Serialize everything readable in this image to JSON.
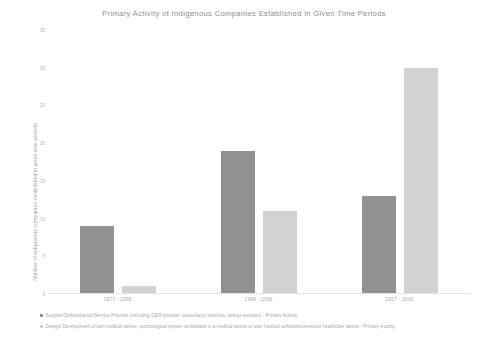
{
  "chart_data": {
    "type": "bar",
    "title": "Primary Activity of Indigenous Companies Established in Given Time Periods",
    "xlabel": "",
    "ylabel": "Number of indigenous companies established in given time periods",
    "categories": [
      "1977 - 1995",
      "1996 - 2006",
      "2007 - 2016"
    ],
    "series": [
      {
        "name": "Supplier/Subcontractor/Service Provider (including OEM provider, consultancy services, design services) - Primary Activity",
        "color": "#919191",
        "values": [
          9,
          19,
          13
        ]
      },
      {
        "name": "Design/ Development of own medical device, technological system embedded in a medical device or own medical software/connected healthcare device - Primary Activity",
        "color": "#d2d2d2",
        "values": [
          1,
          11,
          30
        ]
      }
    ],
    "ylim": [
      0,
      35
    ],
    "yticks": [
      0,
      5,
      10,
      15,
      20,
      25,
      30,
      35
    ],
    "ytick_labels": [
      "0",
      "5",
      "10",
      "15",
      "20",
      "25",
      "30",
      "35"
    ],
    "grid": false,
    "legend_position": "bottom-left"
  },
  "legend": {
    "items": [
      {
        "marker": "square-swatch",
        "label": "Supplier/Subcontractor/Service Provider (including OEM provider, consultancy services, design services) - Primary Activity"
      },
      {
        "marker": "square-swatch",
        "label": "Design/ Development of own medical device, technological system embedded in a medical device or own medical software/connected healthcare device - Primary Activity"
      }
    ]
  }
}
